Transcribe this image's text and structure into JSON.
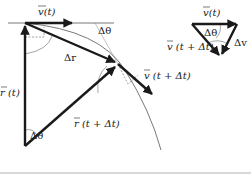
{
  "diagram": {
    "colors": {
      "vector": "#1a1a1a",
      "thin": "#555555",
      "dashed": "#777777",
      "rule": "#d8d8d8"
    },
    "main": {
      "labels": {
        "v_t": "v(t)",
        "delta_theta_top": "Δθ",
        "delta_r": "Δr",
        "r_t": "r (t)",
        "v_t_dt": "v (t + Δt)",
        "r_t_dt": "r (t + Δt)",
        "delta_theta_bottom": "Δθ"
      }
    },
    "inset": {
      "labels": {
        "v_t": "v(t)",
        "delta_theta": "Δθ",
        "delta_v": "Δv",
        "v_t_dt": "v (t + Δt)"
      }
    }
  }
}
